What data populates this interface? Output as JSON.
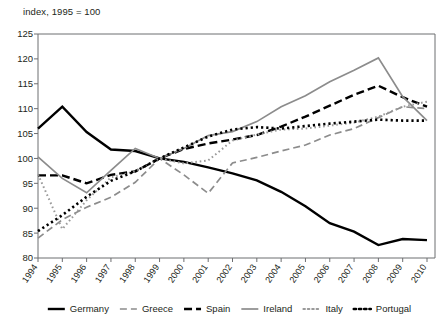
{
  "chart_data": {
    "type": "line",
    "title": "",
    "subtitle": "index, 1995 = 100",
    "xlabel": "",
    "ylabel": "",
    "ylim": [
      80,
      125
    ],
    "yticks": [
      80,
      85,
      90,
      95,
      100,
      105,
      110,
      115,
      120,
      125
    ],
    "grid": false,
    "legend_position": "bottom",
    "categories": [
      "1994",
      "1995",
      "1996",
      "1997",
      "1998",
      "1999",
      "2000",
      "2001",
      "2002",
      "2003",
      "2004",
      "2005",
      "2006",
      "2007",
      "2008",
      "2009",
      "2010"
    ],
    "series": [
      {
        "name": "Germany",
        "style": "solid",
        "color": "#000000",
        "width": 2.4,
        "values": [
          106.0,
          110.4,
          105.3,
          101.8,
          101.5,
          100.0,
          99.3,
          98.2,
          97.0,
          95.6,
          93.3,
          90.4,
          87.0,
          85.3,
          82.6,
          83.8,
          83.6
        ]
      },
      {
        "name": "Greece",
        "style": "dashed",
        "color": "#8c8c8c",
        "width": 1.7,
        "values": [
          84.0,
          87.7,
          90.2,
          92.2,
          95.2,
          100.0,
          96.7,
          93.0,
          99.1,
          100.2,
          101.5,
          102.7,
          104.7,
          106.0,
          108.2,
          110.4,
          110.0
        ]
      },
      {
        "name": "Spain",
        "style": "dashed-bold",
        "color": "#000000",
        "width": 2.4,
        "values": [
          96.6,
          96.6,
          95.0,
          96.7,
          97.4,
          100.0,
          101.9,
          103.0,
          103.8,
          104.7,
          106.4,
          108.4,
          110.6,
          112.8,
          114.6,
          112.3,
          110.4
        ]
      },
      {
        "name": "Ireland",
        "style": "solid",
        "color": "#8c8c8c",
        "width": 1.7,
        "values": [
          100.3,
          96.0,
          93.1,
          97.6,
          102.0,
          100.0,
          102.0,
          104.6,
          105.4,
          107.4,
          110.4,
          112.6,
          115.4,
          117.7,
          120.2,
          112.4,
          107.6
        ]
      },
      {
        "name": "Italy",
        "style": "dotted",
        "color": "#9a9a9a",
        "width": 2.0,
        "values": [
          96.8,
          85.8,
          91.6,
          96.2,
          97.4,
          100.0,
          99.0,
          99.6,
          103.6,
          104.8,
          105.8,
          106.0,
          106.6,
          107.2,
          108.4,
          110.4,
          111.4
        ]
      },
      {
        "name": "Portugal",
        "style": "dotted-bold",
        "color": "#000000",
        "width": 2.6,
        "values": [
          85.4,
          88.6,
          92.3,
          95.5,
          97.4,
          100.0,
          102.2,
          104.4,
          105.8,
          106.3,
          106.0,
          106.5,
          107.0,
          107.4,
          107.8,
          107.6,
          107.6
        ]
      }
    ],
    "legend": [
      {
        "label": "Germany",
        "style": "solid"
      },
      {
        "label": "Greece",
        "style": "dashed"
      },
      {
        "label": "Spain",
        "style": "dashed-bold"
      },
      {
        "label": "Ireland",
        "style": "solid-gray"
      },
      {
        "label": "Italy",
        "style": "dotted"
      },
      {
        "label": "Portugal",
        "style": "dotted-bold"
      }
    ]
  }
}
